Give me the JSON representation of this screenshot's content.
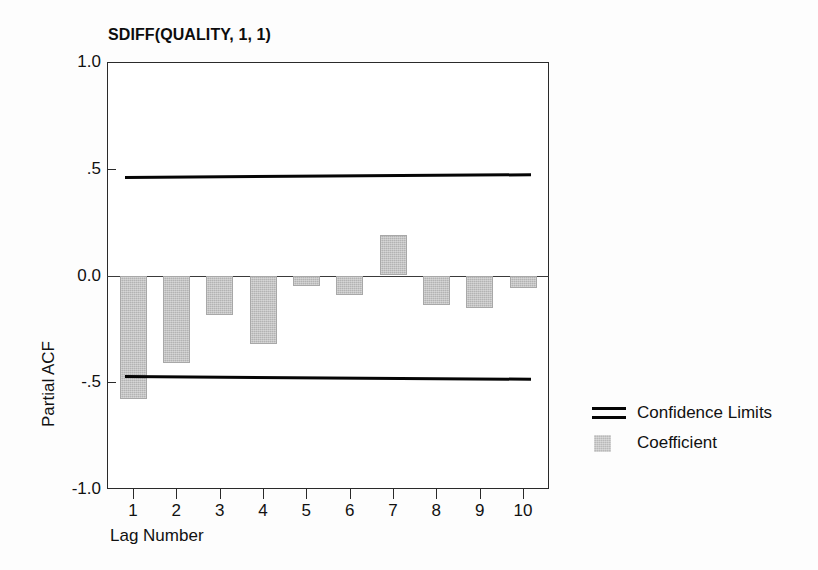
{
  "chart_data": {
    "type": "bar",
    "title": "SDIFF(QUALITY, 1, 1)",
    "xlabel": "Lag Number",
    "ylabel": "Partial ACF",
    "categories": [
      1,
      2,
      3,
      4,
      5,
      6,
      7,
      8,
      9,
      10
    ],
    "values": [
      -0.58,
      -0.41,
      -0.185,
      -0.32,
      -0.05,
      -0.09,
      0.19,
      -0.14,
      -0.15,
      -0.06
    ],
    "series": [
      {
        "name": "Coefficient",
        "values": [
          -0.58,
          -0.41,
          -0.185,
          -0.32,
          -0.05,
          -0.09,
          0.19,
          -0.14,
          -0.15,
          -0.06
        ]
      },
      {
        "name": "Confidence Limits Upper",
        "values": [
          0.465,
          0.466,
          0.468,
          0.469,
          0.471,
          0.472,
          0.474,
          0.475,
          0.477,
          0.478
        ]
      },
      {
        "name": "Confidence Limits Lower",
        "values": [
          -0.465,
          -0.466,
          -0.468,
          -0.469,
          -0.471,
          -0.472,
          -0.474,
          -0.475,
          -0.477,
          -0.478
        ]
      }
    ],
    "ylim": [
      -1.0,
      1.0
    ],
    "xlim": [
      0.4,
      10.6
    ],
    "ytick_labels": [
      "1.0",
      ".5",
      "0.0",
      "-.5",
      "-1.0"
    ],
    "ytick_values": [
      1.0,
      0.5,
      0.0,
      -0.5,
      -1.0
    ],
    "xtick_labels": [
      "1",
      "2",
      "3",
      "4",
      "5",
      "6",
      "7",
      "8",
      "9",
      "10"
    ],
    "grid": false,
    "legend_position": "right",
    "colors": {
      "bar_fill": "#b3b3b3",
      "confidence_line": "#050505",
      "axis": "#2a2a2a",
      "background": "#ffffff"
    }
  },
  "legend": {
    "items": [
      {
        "label": "Confidence Limits",
        "key": "double-line"
      },
      {
        "label": "Coefficient",
        "key": "gray-swatch"
      }
    ]
  }
}
